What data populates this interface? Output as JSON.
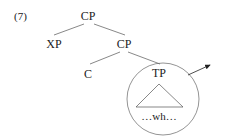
{
  "example_number": "(7)",
  "tree": {
    "root": "CP",
    "specifier": "XP",
    "cbar": "CP",
    "head": "C",
    "complement": "TP",
    "complement_content": "…wh…"
  },
  "colors": {
    "ink": "#222222",
    "line": "#555555",
    "background": "#ffffff"
  }
}
